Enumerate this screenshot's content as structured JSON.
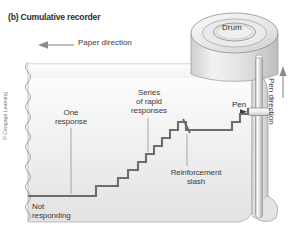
{
  "figure": {
    "title": "(b) Cumulative recorder",
    "copyright": "© Cengage Learning",
    "paper_direction_label": "Paper direction",
    "pen_direction_label": "Pen direction",
    "drum_label": "Drum",
    "pen_label": "Pen"
  },
  "annotations": {
    "one_response": "One\nresponse",
    "one_response_line1": "One",
    "one_response_line2": "response",
    "series_line1": "Series",
    "series_line2": "of rapid",
    "series_line3": "responses",
    "reinforcement_line1": "Reinforcement",
    "reinforcement_line2": "slash",
    "not_responding_line1": "Not",
    "not_responding_line2": "responding"
  },
  "colors": {
    "background": "#ffffff",
    "paper_light": "#f3f3f3",
    "paper_shade": "#dcdcdc",
    "drum_fill": "#e8e8e8",
    "ink": "#6e6e6e",
    "outline": "#8a8a8a",
    "text": "#3b3b3b"
  },
  "chart_data": {
    "type": "line",
    "xlabel": "Time (paper moves left)",
    "ylabel": "Cumulative responses",
    "step_points": [
      [
        28,
        196
      ],
      [
        96,
        196
      ],
      [
        96,
        186
      ],
      [
        118,
        186
      ],
      [
        118,
        178
      ],
      [
        128,
        178
      ],
      [
        128,
        170
      ],
      [
        138,
        170
      ],
      [
        138,
        162
      ],
      [
        146,
        162
      ],
      [
        146,
        154
      ],
      [
        154,
        154
      ],
      [
        154,
        146
      ],
      [
        162,
        146
      ],
      [
        162,
        138
      ],
      [
        170,
        138
      ],
      [
        170,
        130
      ],
      [
        178,
        130
      ],
      [
        178,
        122
      ],
      [
        186,
        122
      ],
      [
        186,
        130
      ],
      [
        232,
        130
      ],
      [
        232,
        122
      ],
      [
        240,
        122
      ],
      [
        240,
        114
      ],
      [
        248,
        114
      ],
      [
        248,
        108
      ]
    ],
    "grid": false,
    "legend": "none"
  }
}
